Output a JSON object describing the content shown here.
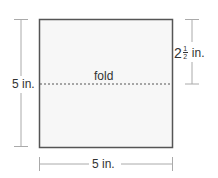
{
  "diagram": {
    "fold_label": "fold",
    "left_dimension": "5 in.",
    "bottom_dimension": "5 in.",
    "right_dimension": {
      "whole": "2",
      "numerator": "1",
      "denominator": "2",
      "unit": "in."
    },
    "colors": {
      "square_stroke": "#555555",
      "square_fill": "#f7f7f7",
      "dimension_line": "#aaaaaa",
      "text": "#333333"
    }
  }
}
